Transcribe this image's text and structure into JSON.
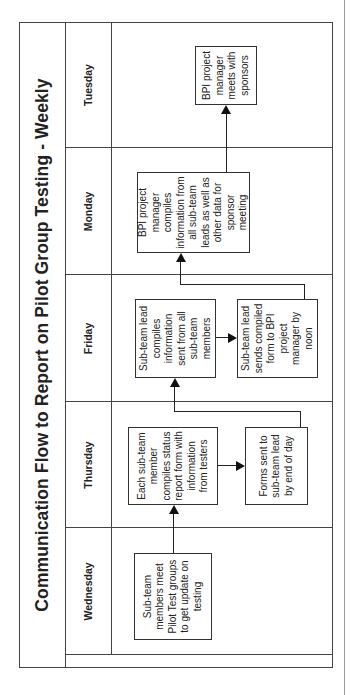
{
  "title": "Communication Flow to Report on Pilot Group Testing - Weekly",
  "lanes": [
    {
      "day": "Wednesday"
    },
    {
      "day": "Thursday"
    },
    {
      "day": "Friday"
    },
    {
      "day": "Monday"
    },
    {
      "day": "Tuesday"
    }
  ],
  "steps": {
    "wednesday_meet": "Sub-team members meet Pilot Test groups to get update on testing",
    "thursday_compile": "Each sub-team member compiles status report form with information from testers",
    "thursday_send": "Forms sent to sub-team lead by end of day",
    "friday_compile": "Sub-team lead compiles information sent from all sub-team members",
    "friday_send": "Sub-team lead sends compiled form to BPI project manager by noon",
    "monday_compile": "BPI project manager compiles information from all sub-team leads as well as other data for sponsor meeting",
    "tuesday_meet": "BPI project manager meets with sponsors"
  },
  "flow": [
    [
      "wednesday_meet",
      "thursday_compile"
    ],
    [
      "thursday_compile",
      "thursday_send"
    ],
    [
      "thursday_send",
      "friday_compile"
    ],
    [
      "friday_compile",
      "friday_send"
    ],
    [
      "friday_send",
      "monday_compile"
    ],
    [
      "monday_compile",
      "tuesday_meet"
    ]
  ]
}
